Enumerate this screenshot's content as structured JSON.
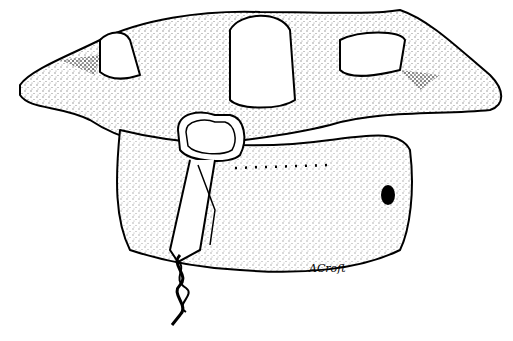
{
  "illustration": {
    "subject": "cervical vertebrae with wire loop fixation",
    "signature": "ACroft",
    "ink_color": "#000000",
    "background": "#ffffff"
  }
}
